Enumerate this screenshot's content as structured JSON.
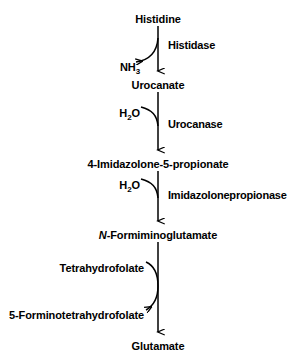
{
  "diagram": {
    "type": "metabolic-pathway",
    "orientation": "vertical-top-to-bottom",
    "stroke_color": "#000000",
    "background_color": "#ffffff"
  },
  "metabolites": [
    {
      "label": "Histidine",
      "x": 158,
      "y": 14
    },
    {
      "label": "Urocanate",
      "x": 158,
      "y": 80
    },
    {
      "label": "4-Imidazolone-5-propionate",
      "x": 158,
      "y": 159
    },
    {
      "label": "N",
      "label_rest": "-Formiminoglutamate",
      "x": 158,
      "y": 230,
      "italic_prefix": true
    },
    {
      "label": "Glutamate",
      "x": 158,
      "y": 341
    }
  ],
  "enzymes": [
    {
      "label": "Histidase",
      "x": 168,
      "y": 40
    },
    {
      "label": "Urocanase",
      "x": 168,
      "y": 119
    },
    {
      "label": "Imidazolonepropionase",
      "x": 168,
      "y": 190
    }
  ],
  "cofactors": [
    {
      "label": "NH",
      "sub": "3",
      "x": 140,
      "y": 62,
      "direction": "out"
    },
    {
      "label": "H",
      "sub": "2",
      "label_rest": "O",
      "x": 140,
      "y": 108,
      "direction": "in"
    },
    {
      "label": "H",
      "sub": "2",
      "label_rest": "O",
      "x": 140,
      "y": 180,
      "direction": "in"
    },
    {
      "label": "Tetrahydrofolate",
      "x": 144,
      "y": 263,
      "direction": "in"
    },
    {
      "label": "5-Forminotetrahydrofolate",
      "x": 144,
      "y": 310,
      "direction": "out"
    }
  ],
  "steps": [
    {
      "substrate": "Histidine",
      "product": "Urocanate",
      "enzyme": "Histidase",
      "released": "NH3"
    },
    {
      "substrate": "Urocanate",
      "product": "4-Imidazolone-5-propionate",
      "enzyme": "Urocanase",
      "consumed": "H2O"
    },
    {
      "substrate": "4-Imidazolone-5-propionate",
      "product": "N-Formiminoglutamate",
      "enzyme": "Imidazolonepropionase",
      "consumed": "H2O"
    },
    {
      "substrate": "N-Formiminoglutamate",
      "product": "Glutamate",
      "consumed": "Tetrahydrofolate",
      "released": "5-Forminotetrahydrofolate"
    }
  ]
}
